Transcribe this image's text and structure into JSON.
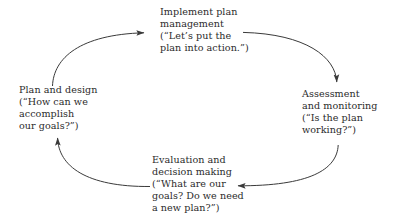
{
  "diagram": {
    "type": "cycle",
    "title": "",
    "background_color": "#ffffff",
    "text_color": "#2b2b2b",
    "arrow_color": "#3a3a3a",
    "direction": "clockwise",
    "nodes": [
      {
        "id": "implement",
        "name": "implement-plan-management",
        "position": "top",
        "lines": [
          "Implement plan",
          "management",
          "(“Let’s put the",
          "plan into action.”)"
        ]
      },
      {
        "id": "assessment",
        "name": "assessment-and-monitoring",
        "position": "right",
        "lines": [
          "Assessment",
          "and monitoring",
          "(“Is the plan",
          "working?”)"
        ]
      },
      {
        "id": "evaluation",
        "name": "evaluation-and-decision-making",
        "position": "bottom",
        "lines": [
          "Evaluation and",
          "decision making",
          "(“What are our",
          "goals? Do we need",
          "a new plan?”)"
        ]
      },
      {
        "id": "plan",
        "name": "plan-and-design",
        "position": "left",
        "lines": [
          "Plan and design",
          "(“How can we",
          "accomplish",
          "our goals?”)"
        ]
      }
    ],
    "arrows": [
      {
        "name": "arrow-plan-to-implement",
        "from": "plan",
        "to": "implement",
        "points_to": "right"
      },
      {
        "name": "arrow-implement-to-assessment",
        "from": "implement",
        "to": "assessment",
        "points_to": "down"
      },
      {
        "name": "arrow-assessment-to-evaluation",
        "from": "assessment",
        "to": "evaluation",
        "points_to": "left"
      },
      {
        "name": "arrow-evaluation-to-plan",
        "from": "evaluation",
        "to": "plan",
        "points_to": "up"
      }
    ]
  }
}
